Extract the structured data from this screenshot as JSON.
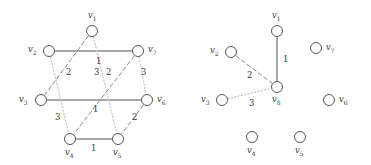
{
  "figure": {
    "title": "",
    "background": "#ffffff",
    "stroke_solid": "#555555",
    "stroke_dashed": "#8a8a8a",
    "stroke_dotted": "#c9c9c9",
    "node_stroke": "#555555",
    "text_color": "#3a3a3a"
  },
  "graphs": [
    {
      "id": "left-graph",
      "name": "original-weighted-graph",
      "nodes": [
        {
          "id": "v1",
          "label": "v",
          "sub": "1",
          "cx": 92,
          "cy": 31,
          "r": 5.5,
          "lx": 88,
          "ly": 11
        },
        {
          "id": "v2",
          "label": "v",
          "sub": "2",
          "cx": 49,
          "cy": 51,
          "r": 5.5,
          "lx": 28,
          "ly": 45
        },
        {
          "id": "v7",
          "label": "v",
          "sub": "7",
          "cx": 138,
          "cy": 51,
          "r": 5.5,
          "lx": 148,
          "ly": 45
        },
        {
          "id": "v3",
          "label": "v",
          "sub": "3",
          "cx": 41,
          "cy": 100,
          "r": 5.5,
          "lx": 19,
          "ly": 95
        },
        {
          "id": "v6",
          "label": "v",
          "sub": "6",
          "cx": 147,
          "cy": 100,
          "r": 5.5,
          "lx": 157,
          "ly": 95
        },
        {
          "id": "v4",
          "label": "v",
          "sub": "4",
          "cx": 70,
          "cy": 139,
          "r": 5.5,
          "lx": 65,
          "ly": 148
        },
        {
          "id": "v5",
          "label": "v",
          "sub": "5",
          "cx": 118,
          "cy": 139,
          "r": 5.5,
          "lx": 113,
          "ly": 148
        }
      ],
      "edges": [
        {
          "from": "v2",
          "to": "v7",
          "style": "solid",
          "weight": "1",
          "lx": 96,
          "ly": 57
        },
        {
          "from": "v3",
          "to": "v6",
          "style": "solid",
          "weight": "1",
          "lx": 93,
          "ly": 105
        },
        {
          "from": "v4",
          "to": "v5",
          "style": "solid",
          "weight": "1",
          "lx": 91,
          "ly": 144
        },
        {
          "from": "v1",
          "to": "v3",
          "style": "dashed",
          "weight": "2",
          "lx": 66,
          "ly": 68
        },
        {
          "from": "v1",
          "to": "v5",
          "style": "dotted",
          "weight": "3",
          "lx": 94,
          "ly": 68
        },
        {
          "from": "v7",
          "to": "v4",
          "style": "dashed",
          "weight": "3",
          "lx": 55,
          "ly": 113
        },
        {
          "from": "v7",
          "to": "v6",
          "style": "dotted",
          "weight": "3",
          "lx": 141,
          "ly": 68
        },
        {
          "from": "v2",
          "to": "v4",
          "style": "dotted",
          "weight": "2",
          "lx": 106,
          "ly": 68
        },
        {
          "from": "v6",
          "to": "v5",
          "style": "dashed",
          "weight": "2",
          "lx": 132,
          "ly": 113
        }
      ]
    },
    {
      "id": "right-graph",
      "name": "reduced-graph-with-v8",
      "nodes": [
        {
          "id": "v1",
          "label": "v",
          "sub": "1",
          "cx": 277,
          "cy": 31,
          "r": 5.5,
          "lx": 272,
          "ly": 11
        },
        {
          "id": "v2",
          "label": "v",
          "sub": "2",
          "cx": 231,
          "cy": 52,
          "r": 5.5,
          "lx": 210,
          "ly": 46
        },
        {
          "id": "v7",
          "label": "v",
          "sub": "7",
          "cx": 316,
          "cy": 48,
          "r": 5.5,
          "lx": 326,
          "ly": 43
        },
        {
          "id": "v3",
          "label": "v",
          "sub": "3",
          "cx": 222,
          "cy": 100,
          "r": 5.5,
          "lx": 201,
          "ly": 95
        },
        {
          "id": "v8",
          "label": "v",
          "sub": "8",
          "cx": 277,
          "cy": 87,
          "r": 5.5,
          "lx": 272,
          "ly": 95
        },
        {
          "id": "v6",
          "label": "v",
          "sub": "6",
          "cx": 329,
          "cy": 100,
          "r": 5.5,
          "lx": 339,
          "ly": 95
        },
        {
          "id": "v4",
          "label": "v",
          "sub": "4",
          "cx": 252,
          "cy": 137,
          "r": 5.5,
          "lx": 247,
          "ly": 146
        },
        {
          "id": "v5",
          "label": "v",
          "sub": "5",
          "cx": 300,
          "cy": 137,
          "r": 5.5,
          "lx": 295,
          "ly": 146
        }
      ],
      "edges": [
        {
          "from": "v1",
          "to": "v8",
          "style": "solid",
          "weight": "1",
          "lx": 283,
          "ly": 55
        },
        {
          "from": "v2",
          "to": "v8",
          "style": "dashed",
          "weight": "2",
          "lx": 247,
          "ly": 71
        },
        {
          "from": "v3",
          "to": "v8",
          "style": "dotted",
          "weight": "3",
          "lx": 249,
          "ly": 99
        }
      ]
    }
  ],
  "chart_data": {
    "type": "diagram",
    "title": "",
    "left_edges": [
      {
        "edge": "v2-v7",
        "weight": 1,
        "style": "solid"
      },
      {
        "edge": "v3-v6",
        "weight": 1,
        "style": "solid"
      },
      {
        "edge": "v4-v5",
        "weight": 1,
        "style": "solid"
      },
      {
        "edge": "v1-v3",
        "weight": 2,
        "style": "dashed"
      },
      {
        "edge": "v1-v5",
        "weight": 3,
        "style": "dotted"
      },
      {
        "edge": "v7-v4",
        "weight": 3,
        "style": "dashed"
      },
      {
        "edge": "v7-v6",
        "weight": 3,
        "style": "dotted"
      },
      {
        "edge": "v2-v4",
        "weight": 2,
        "style": "dotted"
      },
      {
        "edge": "v6-v5",
        "weight": 2,
        "style": "dashed"
      }
    ],
    "right_edges": [
      {
        "edge": "v1-v8",
        "weight": 1,
        "style": "solid"
      },
      {
        "edge": "v2-v8",
        "weight": 2,
        "style": "dashed"
      },
      {
        "edge": "v3-v8",
        "weight": 3,
        "style": "dotted"
      }
    ]
  }
}
